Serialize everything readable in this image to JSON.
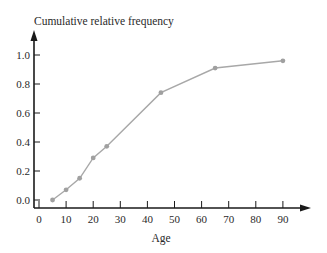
{
  "chart_data": {
    "type": "line",
    "title": "",
    "xlabel": "Age",
    "ylabel": "Cumulative relative frequency",
    "x": [
      5,
      10,
      15,
      20,
      25,
      45,
      65,
      90
    ],
    "series": [
      {
        "name": "Cumulative relative frequency",
        "values": [
          0.0,
          0.07,
          0.15,
          0.29,
          0.37,
          0.74,
          0.91,
          0.96
        ]
      }
    ],
    "xlim": [
      0,
      100
    ],
    "ylim": [
      0,
      1.1
    ],
    "x_ticks": [
      0,
      10,
      20,
      30,
      40,
      50,
      60,
      70,
      80,
      90
    ],
    "x_tick_labels": [
      "0",
      "10",
      "20",
      "30",
      "40",
      "50",
      "60",
      "70",
      "80",
      "90"
    ],
    "y_ticks": [
      0.0,
      0.2,
      0.4,
      0.6,
      0.8,
      1.0
    ],
    "y_tick_labels": [
      "0.0",
      "0.2",
      "0.4",
      "0.6",
      "0.8",
      "1.0"
    ],
    "grid": false,
    "legend": "none",
    "colors": {
      "line": "#a8a8a8",
      "marker": "#a0a0a0",
      "axis": "#1a1a1a"
    }
  }
}
